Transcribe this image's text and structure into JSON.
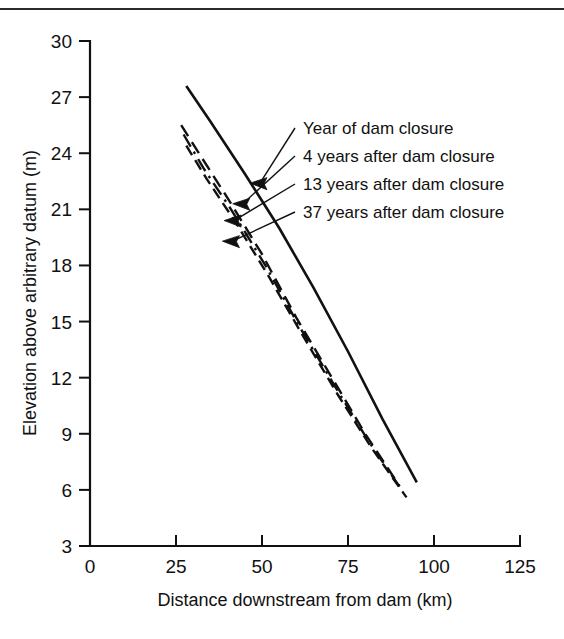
{
  "figure": {
    "top_rule": true,
    "background": "#ffffff",
    "ink_color": "#111111"
  },
  "chart_data": {
    "type": "line",
    "title": "",
    "xlabel": "Distance downstream from dam (km)",
    "ylabel": "Elevation above arbitrary datum (m)",
    "xlim": [
      0,
      125
    ],
    "ylim": [
      3,
      30
    ],
    "xticks": [
      0,
      25,
      50,
      75,
      100,
      125
    ],
    "yticks": [
      3,
      6,
      9,
      12,
      15,
      18,
      21,
      24,
      27,
      30
    ],
    "xticklabels": [
      "0",
      "25",
      "50",
      "75",
      "100",
      "125"
    ],
    "yticklabels": [
      "3",
      "6",
      "9",
      "12",
      "15",
      "18",
      "21",
      "24",
      "27",
      "30"
    ],
    "grid": false,
    "legend_position": "annotation-callouts-right",
    "series": [
      {
        "name": "Year of dam closure",
        "style": "solid",
        "points": [
          [
            28.0,
            27.6
          ],
          [
            35.0,
            25.7
          ],
          [
            45.0,
            22.9
          ],
          [
            55.0,
            20.0
          ],
          [
            65.0,
            16.8
          ],
          [
            75.0,
            13.4
          ],
          [
            85.0,
            9.8
          ],
          [
            95.0,
            6.4
          ]
        ]
      },
      {
        "name": "4 years after dam closure",
        "style": "dashed",
        "points": [
          [
            26.5,
            25.5
          ],
          [
            32.0,
            23.9
          ],
          [
            40.0,
            21.6
          ],
          [
            50.0,
            18.6
          ],
          [
            60.0,
            15.2
          ],
          [
            70.0,
            12.1
          ],
          [
            80.0,
            9.0
          ],
          [
            90.0,
            6.2
          ]
        ]
      },
      {
        "name": "13 years after dam closure",
        "style": "dash-dot",
        "points": [
          [
            27.2,
            25.0
          ],
          [
            33.0,
            23.2
          ],
          [
            41.0,
            21.0
          ],
          [
            51.0,
            18.0
          ],
          [
            61.0,
            14.7
          ],
          [
            71.0,
            11.6
          ],
          [
            81.0,
            8.6
          ],
          [
            91.0,
            5.9
          ]
        ]
      },
      {
        "name": "37 years after dam closure",
        "style": "dashed-short",
        "points": [
          [
            28.0,
            24.4
          ],
          [
            34.0,
            22.6
          ],
          [
            42.0,
            20.4
          ],
          [
            52.0,
            17.4
          ],
          [
            62.0,
            14.2
          ],
          [
            72.0,
            11.1
          ],
          [
            82.0,
            8.2
          ],
          [
            92.0,
            5.6
          ]
        ]
      }
    ],
    "annotations": [
      {
        "text": "Year of dam closure",
        "target_x": 46.5,
        "target_y": 22.4
      },
      {
        "text": "4 years after dam closure",
        "target_x": 41.5,
        "target_y": 21.3
      },
      {
        "text": "13 years after dam closure",
        "target_x": 39.0,
        "target_y": 20.4
      },
      {
        "text": "37 years after dam closure",
        "target_x": 38.5,
        "target_y": 19.3
      }
    ]
  }
}
